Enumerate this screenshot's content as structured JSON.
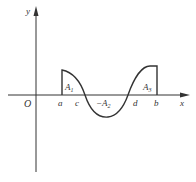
{
  "diagram": {
    "type": "definite-integral-signed-area",
    "axes": {
      "x_label": "x",
      "y_label": "y",
      "origin_label": "O"
    },
    "points": {
      "a": "a",
      "c": "c",
      "d": "d",
      "b": "b"
    },
    "regions": [
      {
        "name": "A1",
        "main": "A",
        "sub": "1",
        "sign": "+",
        "between": [
          "a",
          "c"
        ]
      },
      {
        "name": "-A2",
        "prefix": "−",
        "main": "A",
        "sub": "2",
        "sign": "-",
        "between": [
          "c",
          "d"
        ]
      },
      {
        "name": "A3",
        "main": "A",
        "sub": "3",
        "sign": "+",
        "between": [
          "d",
          "b"
        ]
      }
    ],
    "colors": {
      "stroke": "#333333",
      "background": "#ffffff"
    }
  }
}
